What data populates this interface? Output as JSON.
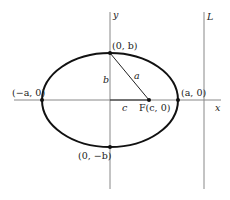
{
  "diagram": {
    "type": "ellipse",
    "axes": {
      "x_label": "x",
      "y_label": "y"
    },
    "directrix_label": "L",
    "points": {
      "top_vertex": "(0, b)",
      "bottom_vertex": "(0, −b)",
      "left_vertex": "(−a, 0)",
      "right_vertex": "(a, 0)",
      "focus": "F(c, 0)"
    },
    "segments": {
      "semi_minor": "b",
      "focal_distance": "c",
      "hypotenuse": "a"
    },
    "colors": {
      "stroke": "#222222",
      "axis": "#888888",
      "background": "#ffffff"
    }
  }
}
